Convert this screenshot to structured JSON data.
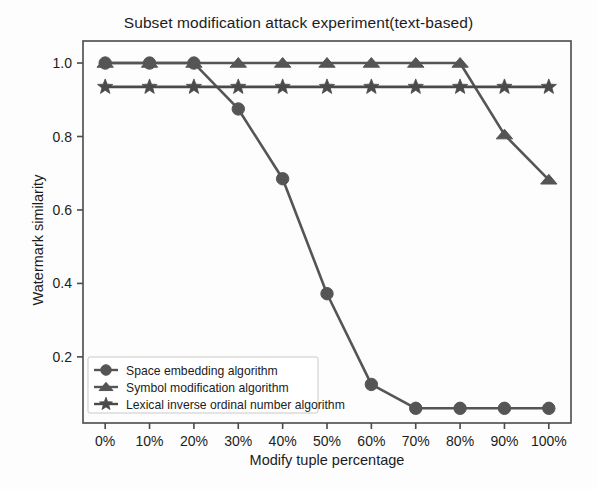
{
  "chart_data": {
    "type": "line",
    "title": "Subset modification attack experiment(text-based)",
    "xlabel": "Modify tuple percentage",
    "ylabel": "Watermark similarity",
    "categories": [
      "0%",
      "10%",
      "20%",
      "30%",
      "40%",
      "50%",
      "60%",
      "70%",
      "80%",
      "90%",
      "100%"
    ],
    "x": [
      0,
      10,
      20,
      30,
      40,
      50,
      60,
      70,
      80,
      90,
      100
    ],
    "xlim": [
      -5,
      105
    ],
    "ylim": [
      0.02,
      1.06
    ],
    "yticks": [
      0.2,
      0.4,
      0.6,
      0.8,
      1.0
    ],
    "ytick_labels": [
      "0.2",
      "0.4",
      "0.6",
      "0.8",
      "1.0"
    ],
    "grid": false,
    "legend_position": "lower left",
    "series": [
      {
        "name": "Space embedding algorithm",
        "marker": "circle",
        "color": "#555555",
        "values": [
          1.0,
          1.0,
          1.0,
          0.875,
          0.685,
          0.372,
          0.125,
          0.06,
          0.06,
          0.06,
          0.06
        ]
      },
      {
        "name": "Symbol modification algorithm",
        "marker": "triangle",
        "color": "#555555",
        "values": [
          1.0,
          1.0,
          1.0,
          1.0,
          1.0,
          1.0,
          1.0,
          1.0,
          1.0,
          0.805,
          0.682
        ]
      },
      {
        "name": "Lexical inverse ordinal number algorithm",
        "marker": "star",
        "color": "#4a4a4a",
        "values": [
          0.935,
          0.935,
          0.935,
          0.935,
          0.935,
          0.935,
          0.935,
          0.935,
          0.935,
          0.935,
          0.935
        ]
      }
    ]
  },
  "legend": {
    "items": [
      "Space embedding algorithm",
      "Symbol modification algorithm",
      "Lexical inverse ordinal number algorithm"
    ]
  },
  "axes": {
    "frame_color": "#4a4a4a"
  }
}
